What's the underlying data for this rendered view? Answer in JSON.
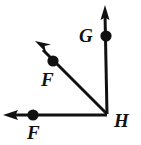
{
  "figure": {
    "background_color": "#ffffff",
    "stroke_color": "#111111",
    "point_color": "#111111",
    "vertex": {
      "name": "H",
      "x": 107,
      "y": 114
    },
    "labels": {
      "g": "G",
      "h": "H",
      "f_diagonal": "F",
      "f_horizontal": "F"
    },
    "rays": [
      {
        "name": "ray-HG-vertical",
        "from": {
          "x": 107,
          "y": 114
        },
        "to": {
          "x": 105,
          "y": 12
        },
        "arrow_tip": {
          "x": 105,
          "y": 6
        },
        "direction": "up",
        "point": {
          "label": "G",
          "x": 106,
          "y": 36,
          "radius": 5.5
        }
      },
      {
        "name": "ray-HF-diagonal",
        "from": {
          "x": 107,
          "y": 114
        },
        "to": {
          "x": 42,
          "y": 49
        },
        "arrow_tip": {
          "x": 35,
          "y": 41
        },
        "direction": "up-left",
        "point": {
          "label": "F",
          "x": 53,
          "y": 61,
          "radius": 5.5
        }
      },
      {
        "name": "ray-HF-horizontal",
        "from": {
          "x": 107,
          "y": 115
        },
        "to": {
          "x": 11,
          "y": 115
        },
        "arrow_tip": {
          "x": 3,
          "y": 115
        },
        "direction": "left",
        "point": {
          "label": "F",
          "x": 33,
          "y": 115,
          "radius": 5.5
        }
      }
    ]
  }
}
